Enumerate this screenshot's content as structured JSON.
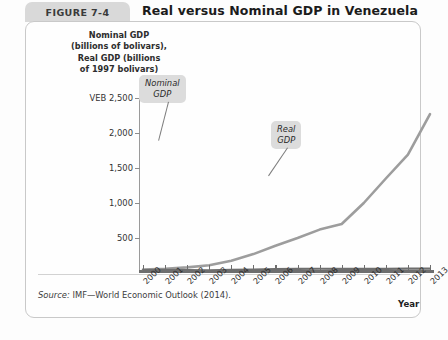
{
  "figure": {
    "tab_label": "FIGURE 7-4",
    "title": "Real versus Nominal GDP in Venezuela",
    "source": "Source: IMF—World Economic Outlook (2014)."
  },
  "chart_data": {
    "type": "line",
    "title": "Real versus Nominal GDP in Venezuela",
    "xlabel": "Year",
    "ylabel": "Nominal GDP (billions of bolivars), Real GDP (billions of 1997 bolivars)",
    "y_unit_prefix": "VEB",
    "ylim": [
      0,
      2500
    ],
    "ytick_labels": [
      "VEB 2,500",
      "2,000",
      "1,500",
      "1,000",
      "500"
    ],
    "ytick_values": [
      2500,
      2000,
      1500,
      1000,
      500
    ],
    "grid": false,
    "legend_position": "inline-callouts",
    "categories": [
      "2000",
      "2001",
      "2002",
      "2003",
      "2004",
      "2005",
      "2006",
      "2007",
      "2008",
      "2009",
      "2010",
      "2011",
      "2012",
      "2013"
    ],
    "series": [
      {
        "name": "Nominal GDP",
        "color": "#9d9d9d",
        "values": [
          48,
          60,
          80,
          110,
          175,
          270,
          390,
          500,
          620,
          700,
          1000,
          1350,
          1690,
          2270
        ]
      },
      {
        "name": "Real GDP",
        "color": "#6e6e6e",
        "values": [
          42,
          44,
          41,
          38,
          45,
          50,
          55,
          60,
          61,
          59,
          58,
          60,
          62,
          63
        ]
      }
    ],
    "annotations": [
      {
        "text_line1": "Nominal",
        "text_line2": "GDP"
      },
      {
        "text_line1": "Real",
        "text_line2": "GDP"
      }
    ]
  }
}
